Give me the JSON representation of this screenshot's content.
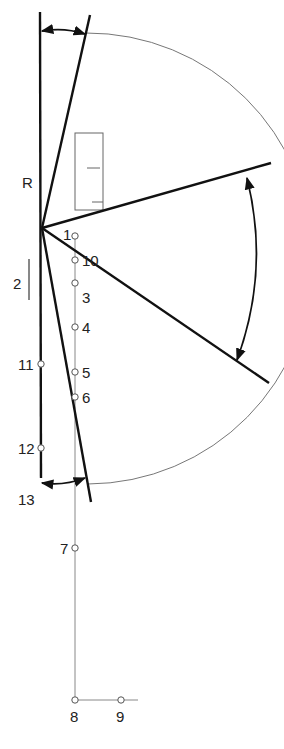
{
  "diagram": {
    "colors": {
      "stroke": "#111111",
      "thin": "#777777",
      "background": "#ffffff"
    },
    "labels": {
      "R": "R",
      "2": "2",
      "1": "1",
      "10": "10",
      "3": "3",
      "4": "4",
      "5": "5",
      "6": "6",
      "11": "11",
      "12": "12",
      "13": "13",
      "7": "7",
      "8": "8",
      "9": "9"
    }
  }
}
